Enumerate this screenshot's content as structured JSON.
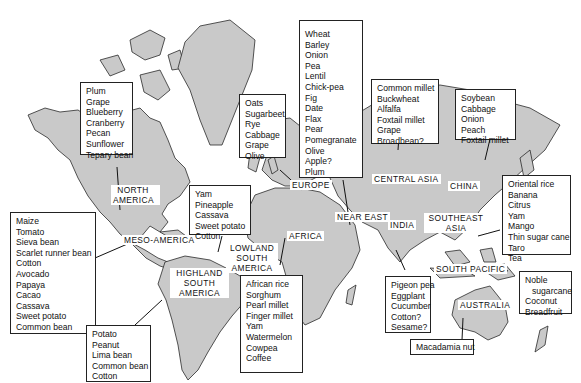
{
  "regions": {
    "north_america": "NORTH AMERICA",
    "meso_america": "MESO-AMERICA",
    "highland_south_america": "HIGHLAND SOUTH AMERICA",
    "lowland_south_america": "LOWLAND SOUTH AMERICA",
    "europe": "EUROPE",
    "africa": "AFRICA",
    "near_east": "NEAR EAST",
    "central_asia": "CENTRAL ASIA",
    "india": "INDIA",
    "china": "CHINA",
    "southeast_asia": "SOUTHEAST ASIA",
    "south_pacific": "SOUTH PACIFIC",
    "australia": "AUSTRALIA"
  },
  "crops": {
    "north_america": [
      "Plum",
      "Grape",
      "Blueberry",
      "Cranberry",
      "Pecan",
      "Sunflower",
      "Tepary bean"
    ],
    "meso_america": [
      "Maize",
      "Tomato",
      "Sieva bean",
      "Scarlet runner bean",
      "Cotton",
      "Avocado",
      "Papaya",
      "Cacao",
      "Cassava",
      "Sweet potato",
      "Common bean"
    ],
    "highland_south_america": [
      "Potato",
      "Peanut",
      "Lima bean",
      "Common bean",
      "Cotton"
    ],
    "lowland_south_america": [
      "Yam",
      "Pineapple",
      "Cassava",
      "Sweet potato",
      "Cotton"
    ],
    "europe": [
      "Oats",
      "Sugarbeet",
      "Rye",
      "Cabbage",
      "Grape",
      "Olive"
    ],
    "africa": [
      "African rice",
      "Sorghum",
      "Pearl millet",
      "Finger millet",
      "Yam",
      "Watermelon",
      "Cowpea",
      "Coffee"
    ],
    "near_east": [
      "Wheat",
      "Barley",
      "Onion",
      "Pea",
      "Lentil",
      "Chick-pea",
      "Fig",
      "Date",
      "Flax",
      "Pear",
      "Pomegranate",
      "Olive",
      "Apple?",
      "Plum"
    ],
    "central_asia": [
      "Common millet",
      "Buckwheat",
      "Alfalfa",
      "Foxtail millet",
      "Grape",
      "Broadbean?"
    ],
    "india": [
      "Pigeon pea",
      "Eggplant",
      "Cucumber",
      "Cotton?",
      "Sesame?"
    ],
    "china": [
      "Soybean",
      "Cabbage",
      "Onion",
      "Peach",
      "Foxtail millet"
    ],
    "southeast_asia": [
      "Oriental rice",
      "Banana",
      "Citrus",
      "Yam",
      "Mango",
      "Thin sugar cane",
      "Taro",
      "Tea"
    ],
    "south_pacific": [
      "Noble",
      "   sugarcane",
      "Coconut",
      "Breadfruit"
    ],
    "australia": [
      "Macadamia nut"
    ]
  },
  "colors": {
    "land": "#c9c9c9",
    "ocean": "#ffffff",
    "outline": "#2a2a2a"
  }
}
